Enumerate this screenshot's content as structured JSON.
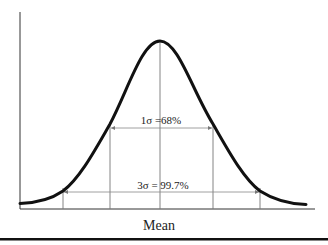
{
  "diagram": {
    "type": "normal-distribution",
    "labels": {
      "one_sigma": "1σ =68%",
      "three_sigma": "3σ = 99.7%",
      "x_axis": "Mean"
    },
    "colors": {
      "curve": "#111111",
      "axis": "#333333",
      "guide": "#777777",
      "background": "#ffffff"
    }
  }
}
